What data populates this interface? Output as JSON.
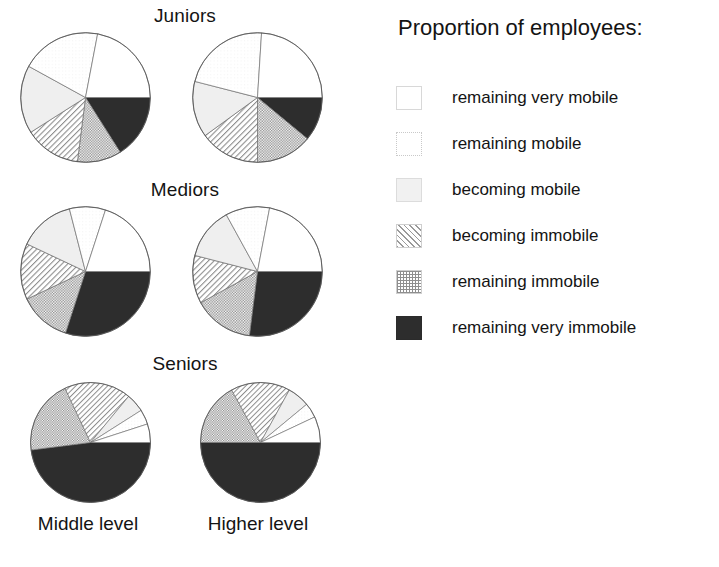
{
  "legend": {
    "title": "Proportion of employees:",
    "items": [
      {
        "label": "remaining very mobile",
        "pattern": "white",
        "swatch_class": "sw-white"
      },
      {
        "label": "remaining mobile",
        "pattern": "faint-dots",
        "swatch_class": "sw-dots-faint"
      },
      {
        "label": "becoming mobile",
        "pattern": "light-gray",
        "swatch_class": "sw-lightgray"
      },
      {
        "label": "becoming immobile",
        "pattern": "diagonal-hatch",
        "swatch_class": "sw-hatch"
      },
      {
        "label": "remaining immobile",
        "pattern": "checker-dots",
        "swatch_class": "sw-check"
      },
      {
        "label": "remaining very immobile",
        "pattern": "solid-dark",
        "swatch_class": "sw-solid"
      }
    ]
  },
  "column_labels": [
    "Middle level",
    "Higher level"
  ],
  "row_titles": [
    "Juniors",
    "Mediors",
    "Seniors"
  ],
  "chart_data": {
    "type": "pie",
    "title": "Proportion of employees:",
    "categories": [
      "remaining very mobile",
      "remaining mobile",
      "becoming mobile",
      "becoming immobile",
      "remaining immobile",
      "remaining very immobile"
    ],
    "units": "percent",
    "grid": false,
    "legend_position": "right",
    "charts": [
      {
        "row": "Juniors",
        "column": "Middle level",
        "values": [
          22,
          20,
          17,
          14,
          11,
          16
        ]
      },
      {
        "row": "Juniors",
        "column": "Higher level",
        "values": [
          24,
          22,
          14,
          15,
          14,
          11
        ]
      },
      {
        "row": "Mediors",
        "column": "Middle level",
        "values": [
          20,
          9,
          14,
          14,
          13,
          30
        ]
      },
      {
        "row": "Mediors",
        "column": "Higher level",
        "values": [
          22,
          11,
          13,
          12,
          15,
          27
        ]
      },
      {
        "row": "Seniors",
        "column": "Middle level",
        "values": [
          5,
          4,
          5,
          18,
          20,
          48
        ]
      },
      {
        "row": "Seniors",
        "column": "Higher level",
        "values": [
          7,
          4,
          6,
          16,
          17,
          50
        ]
      }
    ]
  }
}
